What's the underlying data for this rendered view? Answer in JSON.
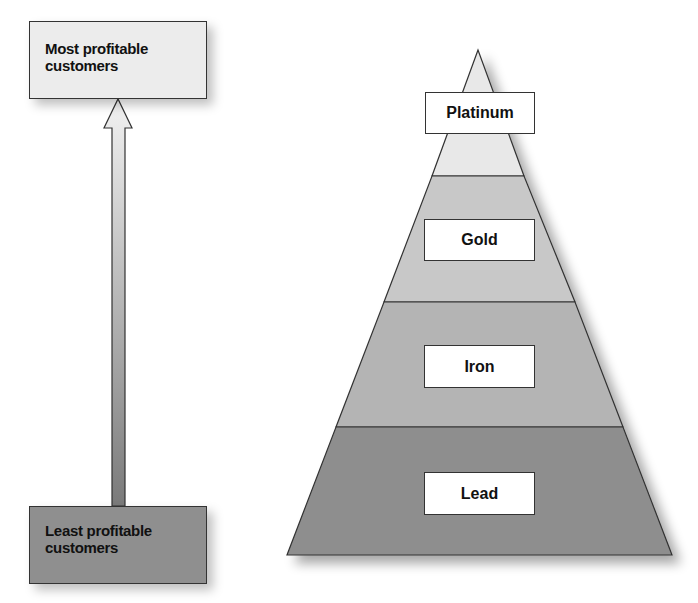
{
  "left_scale": {
    "top_label": "Most profitable customers",
    "top_label_lines": [
      "Most profitable",
      "customers"
    ],
    "bottom_label": "Least profitable customers",
    "bottom_label_lines": [
      "Least profitable",
      "customers"
    ],
    "arrow_direction": "up"
  },
  "pyramid": {
    "tiers": [
      {
        "label": "Platinum",
        "color": "#e8e8e8"
      },
      {
        "label": "Gold",
        "color": "#c8c8c8"
      },
      {
        "label": "Iron",
        "color": "#b4b4b4"
      },
      {
        "label": "Lead",
        "color": "#8e8e8e"
      }
    ]
  }
}
